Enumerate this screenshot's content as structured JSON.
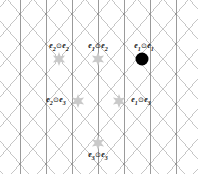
{
  "figure": {
    "name": "triangular-lattice-symmetric-products",
    "width": 198,
    "height": 174,
    "background_color": "#ffffff"
  },
  "lattice": {
    "line_color": "#b8b8b8",
    "line_color_strong": "#9a9a9a",
    "line_width": 0.8,
    "spacing_x": 26,
    "spacing_y": 30,
    "directions": [
      "vertical",
      "diagonal-up-right",
      "diagonal-down-right"
    ]
  },
  "markers": {
    "highlight_color": "#c9c9c9",
    "filled_color": "#000000",
    "star_radius": 7,
    "dot_radius": 6.5,
    "items": [
      {
        "id": "marker-e2-e2",
        "type": "star",
        "x": 59,
        "y": 59,
        "label_e_left": "e",
        "label_sub_left": "2",
        "label_op": "⊙",
        "label_e_right": "e",
        "label_sub_right": "2",
        "label_x": 59,
        "label_y": 47
      },
      {
        "id": "marker-e1-e2",
        "type": "star",
        "x": 98,
        "y": 59,
        "label_e_left": "e",
        "label_sub_left": "1",
        "label_op": "⊙",
        "label_e_right": "e",
        "label_sub_right": "2",
        "label_x": 98,
        "label_y": 47
      },
      {
        "id": "marker-e1-e1",
        "type": "dot",
        "x": 142,
        "y": 59,
        "label_e_left": "e",
        "label_sub_left": "1",
        "label_op": "⊙",
        "label_e_right": "e",
        "label_sub_right": "1",
        "label_x": 144,
        "label_y": 47
      },
      {
        "id": "marker-e2-e3",
        "type": "star",
        "x": 78,
        "y": 101,
        "label_e_left": "e",
        "label_sub_left": "2",
        "label_op": "⊙",
        "label_e_right": "e",
        "label_sub_right": "3",
        "label_x": 56,
        "label_y": 101
      },
      {
        "id": "marker-e1-e3",
        "type": "star",
        "x": 119,
        "y": 101,
        "label_e_left": "e",
        "label_sub_left": "1",
        "label_op": "⊙",
        "label_e_right": "e",
        "label_sub_right": "3",
        "label_x": 141,
        "label_y": 101
      },
      {
        "id": "marker-e3-e3",
        "type": "star",
        "x": 98,
        "y": 143,
        "label_e_left": "e",
        "label_sub_left": "3",
        "label_op": "⊙",
        "label_e_right": "e",
        "label_sub_right": "3",
        "label_x": 98,
        "label_y": 156
      }
    ]
  }
}
